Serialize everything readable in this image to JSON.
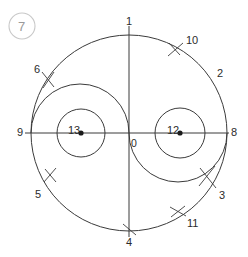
{
  "figure": {
    "badge": {
      "text": "7",
      "shape": "circle-outline",
      "color": "#9a9a9a",
      "border_color": "#c8c8c8"
    },
    "line_color": "#3b3b3b",
    "background": "#ffffff",
    "labels": [
      {
        "id": "label-1",
        "text": "1",
        "x": 126,
        "y": 16
      },
      {
        "id": "label-10",
        "text": "10",
        "x": 186,
        "y": 35
      },
      {
        "id": "label-2",
        "text": "2",
        "x": 217,
        "y": 68
      },
      {
        "id": "label-6",
        "text": "6",
        "x": 34,
        "y": 64
      },
      {
        "id": "label-9",
        "text": "9",
        "x": 17,
        "y": 127
      },
      {
        "id": "label-13",
        "text": "13",
        "x": 68,
        "y": 125
      },
      {
        "id": "label-0",
        "text": "0",
        "x": 131,
        "y": 138
      },
      {
        "id": "label-12",
        "text": "12",
        "x": 167,
        "y": 125
      },
      {
        "id": "label-8",
        "text": "8",
        "x": 231,
        "y": 127
      },
      {
        "id": "label-3",
        "text": "3",
        "x": 219,
        "y": 190
      },
      {
        "id": "label-5",
        "text": "5",
        "x": 35,
        "y": 189
      },
      {
        "id": "label-11",
        "text": "11",
        "x": 187,
        "y": 218
      },
      {
        "id": "label-4",
        "text": "4",
        "x": 126,
        "y": 237
      }
    ],
    "geometry": {
      "outer_circle": {
        "cx": 129,
        "cy": 133,
        "r": 98
      },
      "left_lobe_arc": {
        "cx": 80,
        "cy": 133,
        "r": 49,
        "direction": "up"
      },
      "right_lobe_arc": {
        "cx": 178,
        "cy": 133,
        "r": 49,
        "direction": "down"
      },
      "left_small_circle": {
        "cx": 81,
        "cy": 133,
        "r": 24
      },
      "right_small_circle": {
        "cx": 180,
        "cy": 133,
        "r": 25
      },
      "horizontal_axis": {
        "x1": 25,
        "y1": 133,
        "x2": 229,
        "y2": 133
      },
      "vertical_axis": {
        "x1": 129,
        "y1": 26,
        "x2": 129,
        "y2": 237
      },
      "left_center_dot": {
        "cx": 81,
        "cy": 133,
        "r": 2.6
      },
      "right_center_dot": {
        "cx": 180,
        "cy": 133,
        "r": 2.6
      }
    }
  }
}
